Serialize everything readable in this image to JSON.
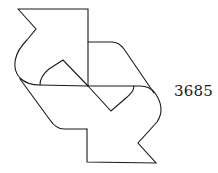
{
  "figure": {
    "number": "3685",
    "colors": {
      "stroke": "#1a1a1a",
      "background": "#ffffff"
    }
  }
}
